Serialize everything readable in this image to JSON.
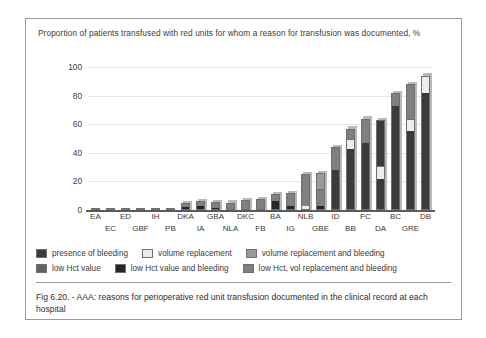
{
  "chart_title": "Proportion of patients transfused with red units for whom a reason for transfusion was documented, %",
  "caption": "Fig 6.20. - AAA: reasons for perioperative red unit transfusion documented in the clinical record at each hospital",
  "colors": {
    "presence_of_bleeding": "#3b3b3b",
    "volume_replacement": "#ededed",
    "volume_replacement_and_bleeding": "#9a9a9a",
    "low_hct_value": "#616161",
    "low_hct_value_and_bleeding": "#262626",
    "low_hct_vol_replacement_and_bleeding": "#808080",
    "gridline": "#e6e6e6",
    "axis": "#5a5a5a",
    "frame": "#9a9a9a",
    "text": "#3b3b3b"
  },
  "legend": [
    {
      "label": "presence of bleeding",
      "color": "#3b3b3b"
    },
    {
      "label": "volume replacement",
      "color": "#ededed"
    },
    {
      "label": "volume replacement and bleeding",
      "color": "#9a9a9a"
    },
    {
      "label": "low Hct value",
      "color": "#616161"
    },
    {
      "label": "low Hct value and bleeding",
      "color": "#262626"
    },
    {
      "label": "low Hct, vol replacement and bleeding",
      "color": "#808080"
    }
  ],
  "chart_data": {
    "type": "bar",
    "stacked": true,
    "title": "Proportion of patients transfused with red units for whom a reason for transfusion was documented, %",
    "xlabel": "",
    "ylabel": "Proportion of patients transfused with red units for whom a reason for transfusion was documented, %",
    "ylim": [
      0,
      100
    ],
    "yticks": [
      0,
      20,
      40,
      60,
      80,
      100
    ],
    "grid": true,
    "legend_position": "below-plot",
    "categories": [
      "EA",
      "EC",
      "ED",
      "GBF",
      "IH",
      "PB",
      "DKA",
      "IA",
      "GBA",
      "NLA",
      "DKC",
      "FB",
      "BA",
      "IG",
      "NLB",
      "GBE",
      "ID",
      "BB",
      "FC",
      "DA",
      "BC",
      "GRE",
      "DB"
    ],
    "series": [
      {
        "name": "presence of bleeding",
        "values": [
          0,
          0,
          0,
          0,
          0,
          0,
          2.0,
          2.5,
          1.5,
          0,
          1.0,
          0,
          6.0,
          3.0,
          0,
          0,
          28.0,
          43.0,
          47.0,
          22.0,
          73.0,
          55.0,
          82.0
        ]
      },
      {
        "name": "volume replacement",
        "values": [
          0,
          0,
          0,
          0,
          0,
          0,
          0,
          0,
          0,
          0,
          0,
          0,
          0,
          0,
          3.0,
          3.0,
          0,
          7.0,
          0,
          9.0,
          0,
          9.0,
          0
        ]
      },
      {
        "name": "volume replacement and bleeding",
        "values": [
          0,
          0,
          0,
          0,
          0,
          0,
          0,
          0,
          0,
          0,
          0,
          0,
          0,
          0,
          0,
          0,
          0,
          0,
          0,
          0,
          0,
          0,
          0
        ]
      },
      {
        "name": "low Hct value",
        "values": [
          0,
          0,
          0,
          0,
          0,
          0,
          0,
          0,
          0,
          0,
          0,
          0,
          0,
          0,
          0,
          0,
          0,
          0,
          0,
          0,
          0,
          0,
          0
        ]
      },
      {
        "name": "low Hct value and bleeding",
        "values": [
          0,
          0,
          0,
          0,
          0,
          0,
          0,
          0,
          0,
          0,
          0,
          0,
          0,
          0,
          0,
          0,
          0,
          0,
          0,
          0,
          0,
          0,
          0
        ]
      },
      {
        "name": "low Hct, vol replacement and bleeding",
        "values": [
          0.5,
          0.8,
          1.0,
          1.2,
          1.4,
          1.6,
          3.0,
          3.5,
          4.0,
          5.0,
          6.0,
          7.0,
          5.0,
          9.0,
          22.0,
          23.0,
          16.0,
          7.0,
          17.0,
          32.0,
          9.0,
          24.0,
          12.0
        ]
      }
    ],
    "totals": [
      0.5,
      0.8,
      1.0,
      1.2,
      1.4,
      1.6,
      5,
      6,
      5.5,
      5,
      7,
      7,
      11,
      12,
      25,
      26,
      44,
      57,
      64,
      63,
      82,
      88,
      94
    ]
  },
  "bars": [
    {
      "cat": "EA",
      "row": 0,
      "segments": []
    },
    {
      "cat": "EC",
      "row": 1,
      "segments": []
    },
    {
      "cat": "ED",
      "row": 0,
      "segments": []
    },
    {
      "cat": "GBF",
      "row": 1,
      "segments": []
    },
    {
      "cat": "IH",
      "row": 0,
      "segments": []
    },
    {
      "cat": "PB",
      "row": 1,
      "segments": []
    },
    {
      "cat": "DKA",
      "row": 0,
      "segments": [
        {
          "v": 2.0,
          "c": "#262626"
        },
        {
          "v": 3.0,
          "c": "#808080"
        }
      ]
    },
    {
      "cat": "IA",
      "row": 1,
      "segments": [
        {
          "v": 2.5,
          "c": "#262626"
        },
        {
          "v": 3.5,
          "c": "#808080"
        }
      ]
    },
    {
      "cat": "GBA",
      "row": 0,
      "segments": [
        {
          "v": 1.5,
          "c": "#262626"
        },
        {
          "v": 4.0,
          "c": "#808080"
        }
      ]
    },
    {
      "cat": "NLA",
      "row": 1,
      "segments": [
        {
          "v": 0.8,
          "c": "#262626"
        },
        {
          "v": 4.4,
          "c": "#808080"
        }
      ]
    },
    {
      "cat": "DKC",
      "row": 0,
      "segments": [
        {
          "v": 1.0,
          "c": "#262626"
        },
        {
          "v": 6.0,
          "c": "#808080"
        }
      ]
    },
    {
      "cat": "FB",
      "row": 1,
      "segments": [
        {
          "v": 1.0,
          "c": "#262626"
        },
        {
          "v": 6.5,
          "c": "#808080"
        }
      ]
    },
    {
      "cat": "BA",
      "row": 0,
      "segments": [
        {
          "v": 6.0,
          "c": "#262626"
        },
        {
          "v": 5.0,
          "c": "#808080"
        }
      ]
    },
    {
      "cat": "IG",
      "row": 1,
      "segments": [
        {
          "v": 3.0,
          "c": "#262626"
        },
        {
          "v": 9.0,
          "c": "#808080"
        }
      ]
    },
    {
      "cat": "NLB",
      "row": 0,
      "segments": [
        {
          "v": 3.0,
          "c": "#ededed"
        },
        {
          "v": 22.0,
          "c": "#808080"
        }
      ]
    },
    {
      "cat": "GBE",
      "row": 1,
      "segments": [
        {
          "v": 3.0,
          "c": "#262626"
        },
        {
          "v": 12.0,
          "c": "#808080"
        },
        {
          "v": 11.0,
          "c": "#9a9a9a"
        }
      ]
    },
    {
      "cat": "ID",
      "row": 0,
      "segments": [
        {
          "v": 28.0,
          "c": "#3b3b3b"
        },
        {
          "v": 16.0,
          "c": "#808080"
        }
      ]
    },
    {
      "cat": "BB",
      "row": 1,
      "segments": [
        {
          "v": 43.0,
          "c": "#3b3b3b"
        },
        {
          "v": 7.0,
          "c": "#ededed"
        },
        {
          "v": 7.0,
          "c": "#808080"
        }
      ]
    },
    {
      "cat": "FC",
      "row": 0,
      "segments": [
        {
          "v": 47.0,
          "c": "#3b3b3b"
        },
        {
          "v": 17.0,
          "c": "#808080"
        }
      ]
    },
    {
      "cat": "DA",
      "row": 1,
      "segments": [
        {
          "v": 22.0,
          "c": "#3b3b3b"
        },
        {
          "v": 9.0,
          "c": "#ededed"
        },
        {
          "v": 32.0,
          "c": "#3b3b3b"
        }
      ]
    },
    {
      "cat": "BC",
      "row": 0,
      "segments": [
        {
          "v": 73.0,
          "c": "#3b3b3b"
        },
        {
          "v": 9.0,
          "c": "#808080"
        }
      ]
    },
    {
      "cat": "GRE",
      "row": 1,
      "segments": [
        {
          "v": 55.0,
          "c": "#3b3b3b"
        },
        {
          "v": 9.0,
          "c": "#ededed"
        },
        {
          "v": 24.0,
          "c": "#808080"
        }
      ]
    },
    {
      "cat": "DB",
      "row": 0,
      "segments": [
        {
          "v": 82.0,
          "c": "#3b3b3b"
        },
        {
          "v": 12.0,
          "c": "#ededed"
        }
      ]
    }
  ]
}
